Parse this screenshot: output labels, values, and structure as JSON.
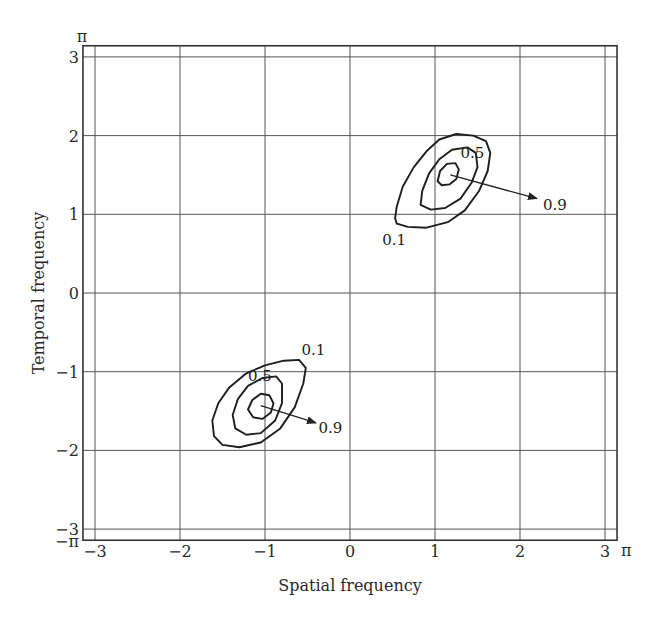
{
  "chart_data": {
    "type": "contour",
    "title": "",
    "xlabel": "Spatial frequency",
    "ylabel": "Temporal frequency",
    "xlim": [
      -3.14159,
      3.14159
    ],
    "ylim": [
      -3.14159,
      3.14159
    ],
    "grid": true,
    "xticks": [
      -3,
      -2,
      -1,
      0,
      1,
      2,
      3
    ],
    "yticks": [
      -3,
      -2,
      -1,
      0,
      1,
      2,
      3
    ],
    "xtick_labels": [
      "−3",
      "−2",
      "−1",
      "0",
      "1",
      "2",
      "3"
    ],
    "ytick_labels": [
      "−3",
      "−2",
      "−1",
      "0",
      "1",
      "2",
      "3"
    ],
    "corner_labels": {
      "y_max": "π",
      "y_min": "−π",
      "x_max": "π"
    },
    "contour_groups": [
      {
        "name": "upper-right",
        "center": [
          1.15,
          1.5
        ],
        "levels": [
          {
            "level": 0.1,
            "points": [
              [
                0.53,
                0.95
              ],
              [
                0.55,
                1.1
              ],
              [
                0.62,
                1.35
              ],
              [
                0.75,
                1.6
              ],
              [
                0.9,
                1.8
              ],
              [
                1.05,
                1.95
              ],
              [
                1.25,
                2.02
              ],
              [
                1.45,
                2.0
              ],
              [
                1.6,
                1.93
              ],
              [
                1.65,
                1.78
              ],
              [
                1.62,
                1.55
              ],
              [
                1.52,
                1.3
              ],
              [
                1.35,
                1.05
              ],
              [
                1.15,
                0.9
              ],
              [
                0.9,
                0.83
              ],
              [
                0.68,
                0.84
              ],
              [
                0.55,
                0.88
              ]
            ]
          },
          {
            "level": 0.5,
            "points": [
              [
                0.83,
                1.12
              ],
              [
                0.85,
                1.3
              ],
              [
                0.93,
                1.52
              ],
              [
                1.05,
                1.7
              ],
              [
                1.2,
                1.82
              ],
              [
                1.38,
                1.85
              ],
              [
                1.48,
                1.78
              ],
              [
                1.5,
                1.6
              ],
              [
                1.43,
                1.4
              ],
              [
                1.3,
                1.2
              ],
              [
                1.12,
                1.08
              ],
              [
                0.95,
                1.06
              ]
            ]
          },
          {
            "level": 0.9,
            "points": [
              [
                1.03,
                1.42
              ],
              [
                1.06,
                1.55
              ],
              [
                1.14,
                1.64
              ],
              [
                1.24,
                1.65
              ],
              [
                1.28,
                1.57
              ],
              [
                1.25,
                1.45
              ],
              [
                1.17,
                1.38
              ],
              [
                1.08,
                1.37
              ]
            ]
          }
        ],
        "labels": [
          {
            "text": "0.1",
            "at": [
              0.38,
              0.67
            ]
          },
          {
            "text": "0.5",
            "at": [
              1.3,
              1.78
            ]
          },
          {
            "text": "0.9",
            "at": [
              2.27,
              1.12
            ]
          }
        ],
        "arrow": {
          "from": [
            1.18,
            1.5
          ],
          "to": [
            2.2,
            1.2
          ]
        }
      },
      {
        "name": "lower-left",
        "center": [
          -1.03,
          -1.42
        ],
        "levels": [
          {
            "level": 0.1,
            "points": [
              [
                -1.6,
                -1.82
              ],
              [
                -1.62,
                -1.62
              ],
              [
                -1.55,
                -1.4
              ],
              [
                -1.42,
                -1.2
              ],
              [
                -1.22,
                -1.02
              ],
              [
                -1.0,
                -0.92
              ],
              [
                -0.78,
                -0.86
              ],
              [
                -0.6,
                -0.85
              ],
              [
                -0.52,
                -0.95
              ],
              [
                -0.55,
                -1.15
              ],
              [
                -0.65,
                -1.45
              ],
              [
                -0.82,
                -1.72
              ],
              [
                -1.05,
                -1.9
              ],
              [
                -1.3,
                -1.96
              ],
              [
                -1.5,
                -1.93
              ]
            ]
          },
          {
            "level": 0.5,
            "points": [
              [
                -1.38,
                -1.55
              ],
              [
                -1.32,
                -1.35
              ],
              [
                -1.2,
                -1.18
              ],
              [
                -1.03,
                -1.08
              ],
              [
                -0.87,
                -1.06
              ],
              [
                -0.8,
                -1.15
              ],
              [
                -0.8,
                -1.4
              ],
              [
                -0.88,
                -1.62
              ],
              [
                -1.05,
                -1.78
              ],
              [
                -1.22,
                -1.8
              ],
              [
                -1.35,
                -1.72
              ]
            ]
          },
          {
            "level": 0.9,
            "points": [
              [
                -1.2,
                -1.48
              ],
              [
                -1.15,
                -1.36
              ],
              [
                -1.05,
                -1.28
              ],
              [
                -0.95,
                -1.3
              ],
              [
                -0.9,
                -1.4
              ],
              [
                -0.93,
                -1.52
              ],
              [
                -1.03,
                -1.6
              ],
              [
                -1.14,
                -1.58
              ]
            ]
          }
        ],
        "labels": [
          {
            "text": "0.1",
            "at": [
              -0.57,
              -0.73
            ]
          },
          {
            "text": "0.5",
            "at": [
              -1.2,
              -1.05
            ]
          },
          {
            "text": "0.9",
            "at": [
              -0.37,
              -1.71
            ]
          }
        ],
        "arrow": {
          "from": [
            -1.05,
            -1.43
          ],
          "to": [
            -0.4,
            -1.65
          ]
        }
      }
    ]
  }
}
